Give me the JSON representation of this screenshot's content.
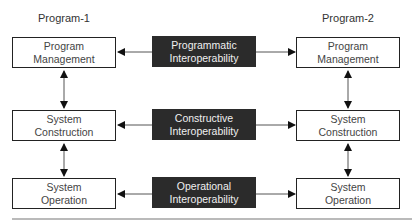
{
  "diagram": {
    "columns": [
      {
        "title": "Program-1"
      },
      {
        "title": "Program-2"
      }
    ],
    "rows": [
      {
        "left": {
          "line1": "Program",
          "line2": "Management"
        },
        "center": {
          "line1": "Programmatic",
          "line2": "Interoperability"
        },
        "right": {
          "line1": "Program",
          "line2": "Management"
        }
      },
      {
        "left": {
          "line1": "System",
          "line2": "Construction"
        },
        "center": {
          "line1": "Constructive",
          "line2": "Interoperability"
        },
        "right": {
          "line1": "System",
          "line2": "Construction"
        }
      },
      {
        "left": {
          "line1": "System",
          "line2": "Operation"
        },
        "center": {
          "line1": "Operational",
          "line2": "Interoperability"
        },
        "right": {
          "line1": "System",
          "line2": "Operation"
        }
      }
    ],
    "colors": {
      "dark_block": "#2b2b2b",
      "line": "#444444"
    }
  }
}
